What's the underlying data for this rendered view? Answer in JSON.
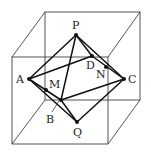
{
  "diagram": {
    "title": "",
    "colors": {
      "background": "#ffffff",
      "lines": "#111111",
      "cube": "#2a2a2a",
      "labels": "#222222"
    },
    "labels": {
      "P": "P",
      "A": "A",
      "B": "B",
      "C": "C",
      "D": "D",
      "Q": "Q",
      "M": "M",
      "N": "N"
    },
    "points": {
      "P": [
        76,
        35
      ],
      "A": [
        29,
        79
      ],
      "B": [
        61,
        100
      ],
      "C": [
        124,
        79
      ],
      "D": [
        92,
        56
      ],
      "Q": [
        77,
        122
      ],
      "M": [
        46,
        90
      ],
      "N": [
        106,
        67
      ]
    },
    "cube": {
      "front_face": [
        [
          12,
          57
        ],
        [
          108,
          57
        ],
        [
          108,
          144
        ],
        [
          12,
          144
        ]
      ],
      "back_face": [
        [
          45,
          12
        ],
        [
          140,
          12
        ],
        [
          140,
          100
        ],
        [
          45,
          100
        ]
      ]
    },
    "edges": [
      [
        "P",
        "A"
      ],
      [
        "P",
        "B"
      ],
      [
        "P",
        "C"
      ],
      [
        "P",
        "D"
      ],
      [
        "A",
        "B"
      ],
      [
        "B",
        "C"
      ],
      [
        "C",
        "D"
      ],
      [
        "D",
        "A"
      ],
      [
        "Q",
        "A"
      ],
      [
        "Q",
        "B"
      ],
      [
        "Q",
        "C"
      ]
    ]
  }
}
